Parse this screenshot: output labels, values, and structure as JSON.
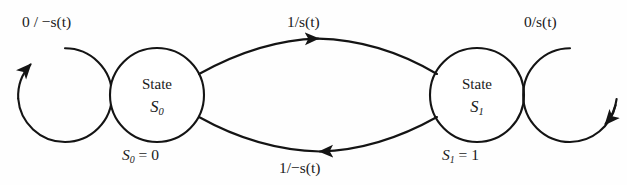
{
  "diagram": {
    "type": "finite-state-machine",
    "title": "",
    "background_color": "#fefefe",
    "stroke_color": "#141414",
    "states": [
      {
        "id": "S0",
        "title": "State",
        "name": "S",
        "subscript": "0",
        "assignment_var": "S",
        "assignment_sub": "0",
        "assignment_value": "0",
        "assignment_text": "S0 = 0",
        "cx": 157,
        "cy": 95,
        "r": 47
      },
      {
        "id": "S1",
        "title": "State",
        "name": "S",
        "subscript": "1",
        "assignment_var": "S",
        "assignment_sub": "1",
        "assignment_value": "1",
        "assignment_text": "S1 = 1",
        "cx": 477,
        "cy": 95,
        "r": 47
      }
    ],
    "transitions": [
      {
        "id": "self-loop-s0",
        "from": "S0",
        "to": "S0",
        "input": "0",
        "output": "-s(t)",
        "label": "0 / -s(t)",
        "label_x": 22,
        "label_y": 14,
        "kind": "self-loop-left"
      },
      {
        "id": "s0-to-s1",
        "from": "S0",
        "to": "S1",
        "input": "1",
        "output": "s(t)",
        "label": "1/s(t)",
        "label_x": 287,
        "label_y": 14,
        "kind": "arc-top"
      },
      {
        "id": "s1-to-s0",
        "from": "S1",
        "to": "S0",
        "input": "1",
        "output": "-s(t)",
        "label": "1/-s(t)",
        "label_x": 279,
        "label_y": 160,
        "kind": "arc-bottom"
      },
      {
        "id": "self-loop-s1",
        "from": "S1",
        "to": "S1",
        "input": "0",
        "output": "s(t)",
        "label": "0/s(t)",
        "label_x": 524,
        "label_y": 14,
        "kind": "self-loop-right"
      }
    ],
    "labels": {
      "top_left": "0 / −s(t)",
      "top_middle": "1/s(t)",
      "top_right": "0/s(t)",
      "bottom_middle": "1/−s(t)",
      "state_word": "State",
      "equals": "=",
      "slash": "/",
      "minus": "−",
      "signal": "s(t)",
      "s0_value": "0",
      "s1_value": "1"
    }
  }
}
